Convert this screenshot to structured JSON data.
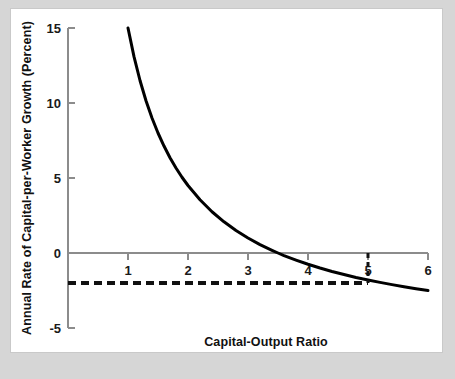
{
  "figure": {
    "background_color": "#d6d6d6",
    "panel_color": "#ffffff",
    "panel_border_color": "#c9c9c9"
  },
  "chart_data": {
    "type": "line",
    "title": "",
    "subtitle": "",
    "xlabel": "Capital-Output Ratio",
    "ylabel": "Annual Rate of Capital-per-Worker Growth (Percent)",
    "xlim": [
      0,
      6
    ],
    "ylim": [
      -5,
      15
    ],
    "xticks": [
      1,
      2,
      3,
      4,
      5,
      6
    ],
    "xticklabels": [
      "1",
      "2",
      "3",
      "4",
      "5",
      "6"
    ],
    "yticks": [
      -5,
      0,
      5,
      10,
      15
    ],
    "yticklabels": [
      "-5",
      "0",
      "5",
      "10",
      "15"
    ],
    "grid": false,
    "legend": "none",
    "series": [
      {
        "name": "Capital-per-worker growth curve",
        "style": "solid",
        "color": "#000000",
        "width": 3,
        "formula": "y = 21 / x - 6",
        "x": [
          1.0,
          1.1,
          1.2,
          1.3,
          1.4,
          1.5,
          1.6,
          1.7,
          1.8,
          1.9,
          2.0,
          2.2,
          2.4,
          2.6,
          2.8,
          3.0,
          3.2,
          3.4,
          3.5,
          3.6,
          3.8,
          4.0,
          4.2,
          4.4,
          4.6,
          4.8,
          5.0,
          5.2,
          5.4,
          5.6,
          5.8,
          6.0
        ],
        "y": [
          15.0,
          13.09,
          11.5,
          10.15,
          9.0,
          8.0,
          7.13,
          6.35,
          5.67,
          5.05,
          4.5,
          3.55,
          2.75,
          2.08,
          1.5,
          1.0,
          0.56,
          0.18,
          0.0,
          -0.17,
          -0.47,
          -0.75,
          -1.0,
          -1.23,
          -1.43,
          -1.63,
          -1.8,
          -1.96,
          -2.11,
          -2.25,
          -2.38,
          -2.5
        ]
      },
      {
        "name": "Steady-state reference line",
        "style": "dashed",
        "color": "#111111",
        "width": 4,
        "y_value": -2,
        "x_from": 0,
        "x_to": 5
      },
      {
        "name": "Steady-state vertical marker",
        "style": "dashed",
        "color": "#111111",
        "width": 3,
        "x_value": 5,
        "y_from": 0,
        "y_to": -2
      }
    ],
    "annotations": [
      {
        "name": "intersection-point",
        "x": 5,
        "y": -2,
        "note": "curve crosses the dashed steady-state line near a capital-output ratio of 5"
      }
    ]
  }
}
